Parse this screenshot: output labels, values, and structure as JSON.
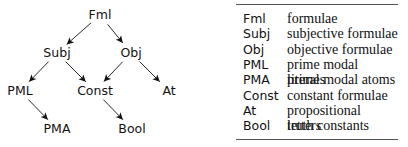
{
  "diagram": {
    "nodes": [
      {
        "id": "Fml",
        "label": "Fml",
        "x": 100,
        "y": 15
      },
      {
        "id": "Subj",
        "label": "Subj",
        "x": 57,
        "y": 53
      },
      {
        "id": "Obj",
        "label": "Obj",
        "x": 131,
        "y": 53
      },
      {
        "id": "PML",
        "label": "PML",
        "x": 20,
        "y": 91
      },
      {
        "id": "Const",
        "label": "Const",
        "x": 95,
        "y": 91
      },
      {
        "id": "At",
        "label": "At",
        "x": 169,
        "y": 91
      },
      {
        "id": "PMA",
        "label": "PMA",
        "x": 57,
        "y": 129
      },
      {
        "id": "Bool",
        "label": "Bool",
        "x": 132,
        "y": 129
      }
    ],
    "edges": [
      {
        "from": "Fml",
        "to": "Subj"
      },
      {
        "from": "Fml",
        "to": "Obj"
      },
      {
        "from": "Subj",
        "to": "PML"
      },
      {
        "from": "Subj",
        "to": "Const"
      },
      {
        "from": "Obj",
        "to": "Const"
      },
      {
        "from": "Obj",
        "to": "At"
      },
      {
        "from": "PML",
        "to": "PMA"
      },
      {
        "from": "Const",
        "to": "Bool"
      }
    ]
  },
  "legend": {
    "rows": [
      {
        "abbr": "Fml",
        "desc": "formulae"
      },
      {
        "abbr": "Subj",
        "desc": "subjective formulae"
      },
      {
        "abbr": "Obj",
        "desc": "objective formulae"
      },
      {
        "abbr": "PML",
        "desc": "prime modal literals"
      },
      {
        "abbr": "PMA",
        "desc": "prime modal atoms"
      },
      {
        "abbr": "Const",
        "desc": "constant formulae"
      },
      {
        "abbr": "At",
        "desc": "propositional letters"
      },
      {
        "abbr": "Bool",
        "desc": "truth constants"
      }
    ]
  }
}
